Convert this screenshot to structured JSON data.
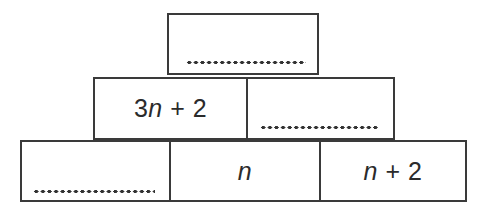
{
  "diagram": {
    "type": "number-wall",
    "rows": 3,
    "background_color": "#ffffff",
    "line_color": "#3a3a3a",
    "text_color": "#2b2b2b",
    "blank_dot_color": "#333333",
    "blank_marker": "...................."
  },
  "cells": {
    "top": {
      "label": "",
      "filled": false,
      "blank_text": "...................."
    },
    "middle_left": {
      "label": "3n + 2",
      "filled": true,
      "parts": {
        "coefficient": "3",
        "variable": "n",
        "operator": " + ",
        "constant": "2"
      }
    },
    "middle_right": {
      "label": "",
      "filled": false,
      "blank_text": "..................."
    },
    "bottom_left": {
      "label": "",
      "filled": false,
      "blank_text": "...................."
    },
    "bottom_middle": {
      "label": "n",
      "filled": true,
      "parts": {
        "variable": "n"
      }
    },
    "bottom_right": {
      "label": "n + 2",
      "filled": true,
      "parts": {
        "variable": "n",
        "operator": " + ",
        "constant": "2"
      }
    }
  }
}
